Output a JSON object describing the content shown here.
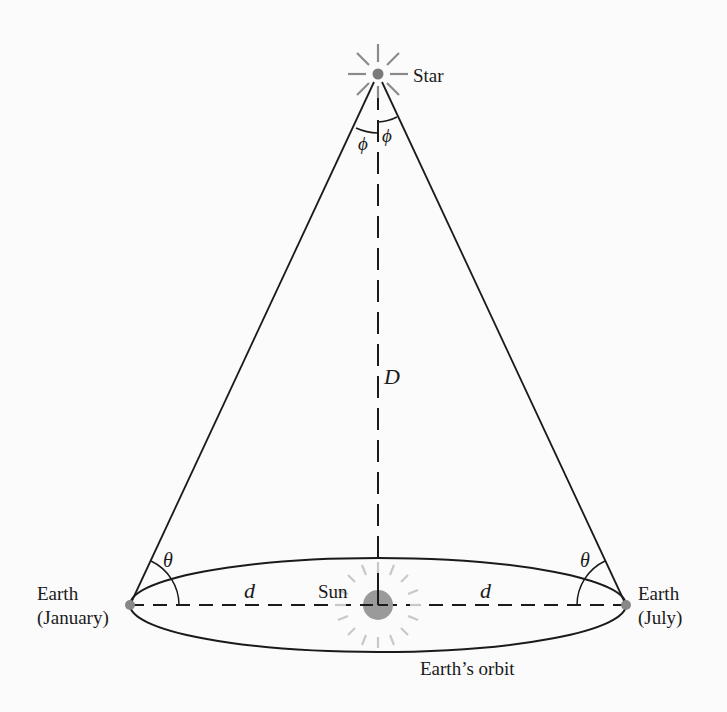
{
  "diagram": {
    "labels": {
      "star": "Star",
      "sun": "Sun",
      "earth_january_line1": "Earth",
      "earth_january_line2": "(January)",
      "earth_july_line1": "Earth",
      "earth_july_line2": "(July)",
      "orbit": "Earth’s orbit",
      "distance_star": "D",
      "distance_left": "d",
      "distance_right": "d",
      "angle_theta_left": "θ",
      "angle_theta_right": "θ",
      "angle_phi_left": "ϕ",
      "angle_phi_right": "ϕ"
    },
    "colors": {
      "line": "#1a1a1a",
      "sun_fill": "#9a9a9a",
      "sun_rays": "#c8c8c8",
      "star_fill": "#7a7a7a",
      "star_rays": "#8a8a8a",
      "background": "#fbfbfb"
    }
  }
}
